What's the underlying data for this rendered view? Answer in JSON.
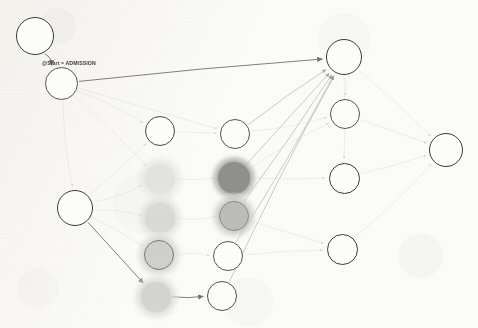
{
  "graph": {
    "title": "Process model graph",
    "background_color": "#fbfbf9",
    "edge_label": "@Start = ADMISSION",
    "nodes": [
      {
        "id": "start",
        "label": "@Start",
        "l1": "@Start",
        "l2": "",
        "x": 35,
        "y": 36,
        "r": 19,
        "style": "plain",
        "size": "big",
        "fill": "#fdfdfc",
        "stroke": "#3a3a3a"
      },
      {
        "id": "admission",
        "label": "ADMISSION",
        "l1": "ADMISSIO",
        "l2": "N",
        "x": 61,
        "y": 83,
        "r": 16.5,
        "style": "plain",
        "size": "sm",
        "fill": "#fdfdfc",
        "stroke": "#555555"
      },
      {
        "id": "triage",
        "label": "TRIAGE",
        "l1": "TRIAGE",
        "l2": "",
        "x": 75,
        "y": 208,
        "r": 18,
        "style": "plain",
        "size": "mid",
        "fill": "#fdfdfc",
        "stroke": "#3a3a3a"
      },
      {
        "id": "wait1",
        "label": "WAIT1",
        "l1": "WAIT1",
        "l2": "",
        "x": 160,
        "y": 131,
        "r": 15,
        "style": "plain",
        "size": "mid",
        "fill": "#fdfdfc",
        "stroke": "#4a4a4a"
      },
      {
        "id": "wait2",
        "label": "WAIT2",
        "l1": "WAIT2",
        "l2": "",
        "x": 160,
        "y": 179,
        "r": 15,
        "style": "fill",
        "size": "mid",
        "fill": "#e3e3e1",
        "stroke": "none"
      },
      {
        "id": "wait3",
        "label": "WAIT3",
        "l1": "WAIT3",
        "l2": "",
        "x": 160,
        "y": 218,
        "r": 15,
        "style": "fill",
        "size": "mid",
        "fill": "#d9d9d6",
        "stroke": "none"
      },
      {
        "id": "wait4",
        "label": "WAIT4",
        "l1": "WAIT4",
        "l2": "",
        "x": 159,
        "y": 255,
        "r": 15,
        "style": "fill",
        "size": "mid",
        "fill": "#cfcfcc",
        "stroke": "#7a7a78"
      },
      {
        "id": "wait5",
        "label": "WAIT5",
        "l1": "WAIT5",
        "l2": "",
        "x": 156,
        "y": 297,
        "r": 15,
        "style": "fill",
        "size": "mid",
        "fill": "#d4d4d1",
        "stroke": "none"
      },
      {
        "id": "at1",
        "label": "ATENTION1",
        "l1": "ATENTIO",
        "l2": "N1",
        "x": 235,
        "y": 134,
        "r": 15,
        "style": "plain",
        "size": "xs",
        "fill": "#fdfdfc",
        "stroke": "#555555"
      },
      {
        "id": "at2",
        "label": "ATENTION2",
        "l1": "ATENTIO",
        "l2": "N2",
        "x": 234,
        "y": 178,
        "r": 16,
        "style": "fill",
        "size": "xs",
        "fill": "#8f8f8c",
        "stroke": "none"
      },
      {
        "id": "at3",
        "label": "ATENTION3",
        "l1": "ATENTIO",
        "l2": "N3",
        "x": 234,
        "y": 216,
        "r": 15,
        "style": "fill",
        "size": "xs",
        "fill": "#bcbcb9",
        "stroke": "#8d8d8a"
      },
      {
        "id": "at4",
        "label": "ATENTION4",
        "l1": "ATENTIO",
        "l2": "N4",
        "x": 228,
        "y": 256,
        "r": 15,
        "style": "plain",
        "size": "xs",
        "fill": "#fdfdfc",
        "stroke": "#555555"
      },
      {
        "id": "at5",
        "label": "ATENTION5",
        "l1": "ATENTIO",
        "l2": "N5",
        "x": 222,
        "y": 296,
        "r": 15,
        "style": "plain",
        "size": "xs",
        "fill": "#fdfdfc",
        "stroke": "#4f4f4f"
      },
      {
        "id": "home",
        "label": "HOME",
        "l1": "HOME",
        "l2": "",
        "x": 344,
        "y": 57,
        "r": 18,
        "style": "plain",
        "size": "big",
        "fill": "#fdfdfc",
        "stroke": "#3a3a3a"
      },
      {
        "id": "hosp",
        "label": "HOSPITALIZATION",
        "l1": "HOSPITALI",
        "l2": "ZATION",
        "x": 345,
        "y": 114,
        "r": 15,
        "style": "plain",
        "size": "xs",
        "fill": "#fdfdfc",
        "stroke": "#555555"
      },
      {
        "id": "others",
        "label": "OTHERS",
        "l1": "OTHERS",
        "l2": "",
        "x": 344,
        "y": 178,
        "r": 15.5,
        "style": "plain",
        "size": "mid",
        "fill": "#fdfdfc",
        "stroke": "#3a3a3a"
      },
      {
        "id": "exitus",
        "label": "EXITUS",
        "l1": "EXITUS",
        "l2": "",
        "x": 342,
        "y": 249,
        "r": 15.5,
        "style": "plain",
        "size": "mid",
        "fill": "#fdfdfc",
        "stroke": "#3a3a3a"
      },
      {
        "id": "end",
        "label": "@End",
        "l1": "@End",
        "l2": "",
        "x": 446,
        "y": 150,
        "r": 17,
        "style": "plain",
        "size": "big",
        "fill": "#fdfdfc",
        "stroke": "#3a3a3a"
      }
    ],
    "edges": [
      {
        "from": "start",
        "to": "admission",
        "weight": "strong"
      },
      {
        "from": "admission",
        "to": "home",
        "weight": "strong"
      },
      {
        "from": "triage",
        "to": "wait5",
        "weight": "strong"
      },
      {
        "from": "wait5",
        "to": "at5",
        "weight": "strong"
      },
      {
        "from": "admission",
        "to": "triage",
        "weight": "faint"
      },
      {
        "from": "admission",
        "to": "wait1",
        "weight": "faint"
      },
      {
        "from": "admission",
        "to": "wait2",
        "weight": "faint"
      },
      {
        "from": "admission",
        "to": "at1",
        "weight": "faint"
      },
      {
        "from": "triage",
        "to": "wait1",
        "weight": "faint"
      },
      {
        "from": "triage",
        "to": "wait2",
        "weight": "faint"
      },
      {
        "from": "triage",
        "to": "wait3",
        "weight": "faint"
      },
      {
        "from": "triage",
        "to": "wait4",
        "weight": "faint"
      },
      {
        "from": "wait1",
        "to": "at1",
        "weight": "faint"
      },
      {
        "from": "wait2",
        "to": "at2",
        "weight": "faint"
      },
      {
        "from": "wait3",
        "to": "at3",
        "weight": "faint"
      },
      {
        "from": "wait4",
        "to": "at4",
        "weight": "faint"
      },
      {
        "from": "at1",
        "to": "home",
        "weight": "medium"
      },
      {
        "from": "at2",
        "to": "home",
        "weight": "medium"
      },
      {
        "from": "at3",
        "to": "home",
        "weight": "medium"
      },
      {
        "from": "at4",
        "to": "home",
        "weight": "medium"
      },
      {
        "from": "at5",
        "to": "home",
        "weight": "medium"
      },
      {
        "from": "at4",
        "to": "exitus",
        "weight": "faint"
      },
      {
        "from": "at3",
        "to": "exitus",
        "weight": "faint"
      },
      {
        "from": "at2",
        "to": "others",
        "weight": "faint"
      },
      {
        "from": "at1",
        "to": "hosp",
        "weight": "faint"
      },
      {
        "from": "at2",
        "to": "hosp",
        "weight": "faint"
      },
      {
        "from": "home",
        "to": "end",
        "weight": "faint"
      },
      {
        "from": "hosp",
        "to": "end",
        "weight": "faint"
      },
      {
        "from": "others",
        "to": "end",
        "weight": "faint"
      },
      {
        "from": "exitus",
        "to": "end",
        "weight": "faint"
      },
      {
        "from": "home",
        "to": "hosp",
        "weight": "faint"
      },
      {
        "from": "home",
        "to": "others",
        "weight": "faint"
      }
    ]
  }
}
